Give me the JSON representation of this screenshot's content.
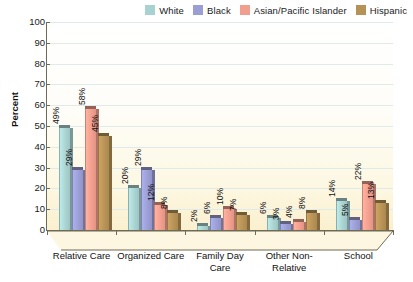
{
  "chart_data": {
    "type": "bar",
    "title": "",
    "xlabel": "",
    "ylabel": "Percent",
    "ylim": [
      0,
      100
    ],
    "ytick_step": 10,
    "yticks": [
      100,
      90,
      80,
      70,
      60,
      50,
      40,
      30,
      20,
      10,
      0
    ],
    "grid": true,
    "legend_position": "top-right",
    "value_suffix": "%",
    "categories": [
      "Relative Care",
      "Organized Care",
      "Family Day Care",
      "Other Non-Relative",
      "School"
    ],
    "series": [
      {
        "name": "White",
        "color": "#a8d2d0",
        "values": [
          49,
          20,
          2,
          6,
          14
        ]
      },
      {
        "name": "Black",
        "color": "#9a9ed4",
        "values": [
          29,
          29,
          6,
          3,
          5
        ]
      },
      {
        "name": "Asian/Pacific Islander",
        "color": "#f19e8e",
        "values": [
          58,
          12,
          10,
          4,
          22
        ]
      },
      {
        "name": "Hispanic",
        "color": "#b79256",
        "values": [
          45,
          8,
          7,
          8,
          13
        ]
      }
    ],
    "data_labels": [
      [
        "49%",
        "29%",
        "58%",
        "45%"
      ],
      [
        "20%",
        "29%",
        "12%",
        "8%"
      ],
      [
        "2%",
        "6%",
        "10%",
        "7%"
      ],
      [
        "6%",
        "3%",
        "4%",
        "8%"
      ],
      [
        "14%",
        "5%",
        "22%",
        "13%"
      ]
    ]
  },
  "colors": {
    "white_series": "#a8d2d0",
    "black_series": "#9a9ed4",
    "asian_series": "#f19e8e",
    "hispanic_series": "#b79256",
    "grid": "#dfeaea",
    "axis": "#6e6a55",
    "plot_bg_top": "#ffffff",
    "plot_bg_bottom": "#faf0cf"
  }
}
